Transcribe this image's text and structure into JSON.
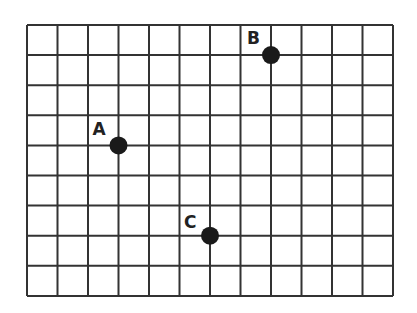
{
  "grid": {
    "columns": 12,
    "rows": 9,
    "origin_x": 27,
    "origin_y": 25,
    "cell_w": 30.5,
    "cell_h": 30.1,
    "line_color": "#333333",
    "line_width": 2
  },
  "points": [
    {
      "label": "A",
      "col": 3,
      "row": 4,
      "label_dx": -26,
      "label_dy": -10
    },
    {
      "label": "B",
      "col": 8,
      "row": 1,
      "label_dx": -24,
      "label_dy": -11
    },
    {
      "label": "C",
      "col": 6,
      "row": 7,
      "label_dx": -26,
      "label_dy": -8
    }
  ],
  "point_color": "#1a1a1a",
  "point_radius": 9
}
